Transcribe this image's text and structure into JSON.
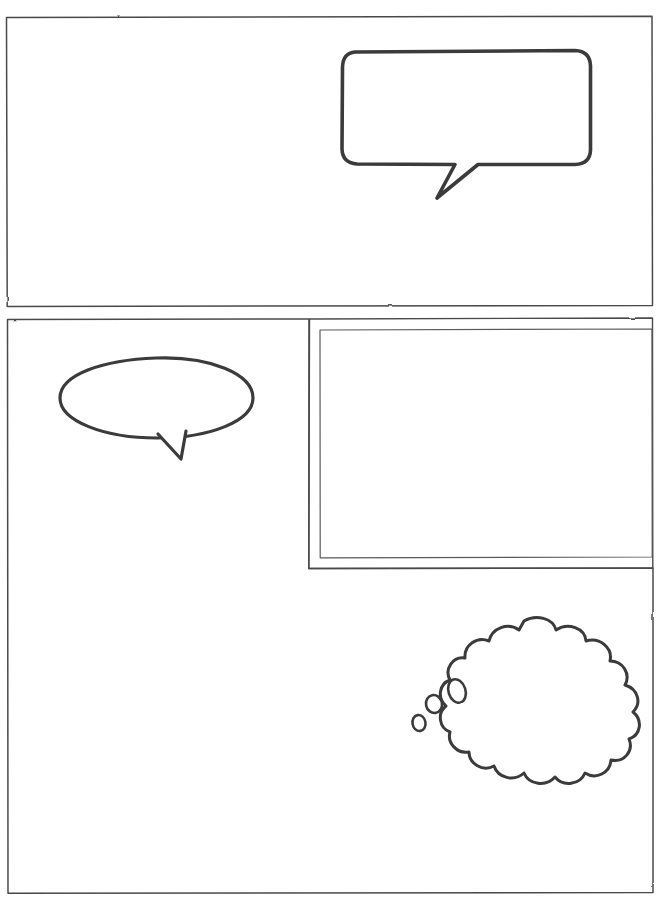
{
  "document": {
    "kind": "comic-page-template",
    "title": "Blank Comic Page Layout",
    "width": 663,
    "height": 898,
    "background_color": "#ffffff",
    "ink_color": "#3a3a3a",
    "ink_color_dark": "#2b2b2b",
    "style": "hand-drawn pencil line art, no text content"
  },
  "panels": [
    {
      "id": "panel-1",
      "label": "Top panel",
      "shape": "rectangle",
      "x": 6,
      "y": 16,
      "width": 647,
      "height": 290,
      "border": "single",
      "contents": "empty"
    },
    {
      "id": "panel-2",
      "label": "Middle left panel",
      "shape": "rectangle",
      "x": 7,
      "y": 319,
      "width": 302,
      "height": 574,
      "border": "single",
      "contents": "oval speech bubble"
    },
    {
      "id": "panel-3",
      "label": "Middle right inset panel",
      "shape": "rectangle",
      "x": 319,
      "y": 319,
      "width": 333,
      "height": 249,
      "border": "double",
      "contents": "empty"
    },
    {
      "id": "panel-4",
      "label": "Bottom right panel",
      "shape": "rectangle",
      "x": 309,
      "y": 568,
      "width": 344,
      "height": 325,
      "border": "single",
      "contents": "cloud thought bubble"
    }
  ],
  "bubbles": [
    {
      "id": "bubble-speech-rect",
      "type": "speech-bubble-rounded-rect",
      "panel": "panel-1",
      "x": 342,
      "y": 52,
      "width": 248,
      "height": 112,
      "tail": "down-left",
      "tail_tip_x": 437,
      "tail_tip_y": 198,
      "text": ""
    },
    {
      "id": "bubble-speech-oval",
      "type": "speech-bubble-oval",
      "panel": "panel-2",
      "x": 60,
      "y": 358,
      "width": 193,
      "height": 80,
      "tail": "down",
      "tail_tip_x": 180,
      "tail_tip_y": 459,
      "text": ""
    },
    {
      "id": "bubble-thought-cloud",
      "type": "thought-bubble-cloud",
      "panel": "panel-4",
      "x": 458,
      "y": 620,
      "width": 157,
      "height": 160,
      "lobes": 12,
      "trail_direction": "down-left",
      "trail_bubbles": [
        {
          "cx": 457,
          "cy": 691,
          "rx": 9,
          "ry": 12
        },
        {
          "cx": 434,
          "cy": 704,
          "rx": 8,
          "ry": 9
        },
        {
          "cx": 419,
          "cy": 723,
          "rx": 6.5,
          "ry": 8
        }
      ],
      "text": ""
    }
  ]
}
